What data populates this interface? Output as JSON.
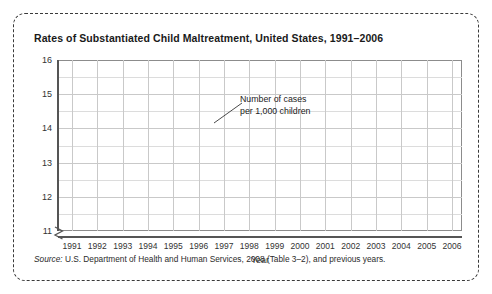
{
  "figure": {
    "title": "Rates of Substantiated Child Maltreatment, United States, 1991–2006",
    "source_label": "Source:",
    "source_text": " U.S. Department of Health and Human Services, 2008 (Table 3–2), and previous years.",
    "annotation_line1": "Number of cases",
    "annotation_line2": "per 1,000 children",
    "border_color": "#3a3a3a",
    "line_color": "#5a5a5a"
  },
  "chart_data": {
    "type": "line",
    "title": "Rates of Substantiated Child Maltreatment, United States, 1991–2006",
    "xlabel": "Year",
    "ylabel": "",
    "categories": [
      1991,
      1992,
      1993,
      1994,
      1995,
      1996,
      1997,
      1998,
      1999,
      2000,
      2001,
      2002,
      2003,
      2004,
      2005,
      2006
    ],
    "values": [
      14.0,
      15.1,
      15.3,
      15.2,
      14.7,
      14.7,
      13.8,
      12.9,
      11.8,
      12.2,
      12.5,
      12.3,
      12.1,
      12.05,
      12.1,
      12.15
    ],
    "ylim": [
      11,
      16
    ],
    "yticks": [
      11,
      12,
      13,
      14,
      15,
      16
    ],
    "ytick_labels": [
      "11",
      "12",
      "13",
      "14",
      "15",
      "16"
    ],
    "xtick_labels": [
      "1991",
      "1992",
      "1993",
      "1994",
      "1995",
      "1996",
      "1997",
      "1998",
      "1999",
      "2000",
      "2001",
      "2002",
      "2003",
      "2004",
      "2005",
      "2006"
    ],
    "grid": true,
    "minor_grid": true,
    "legend": "none",
    "y_axis_break": true,
    "series_name": "Number of cases per 1,000 children",
    "annotations": [
      {
        "text": "Number of cases per 1,000 children",
        "points_to_year": 1997,
        "points_to_value": 13.8
      }
    ]
  }
}
